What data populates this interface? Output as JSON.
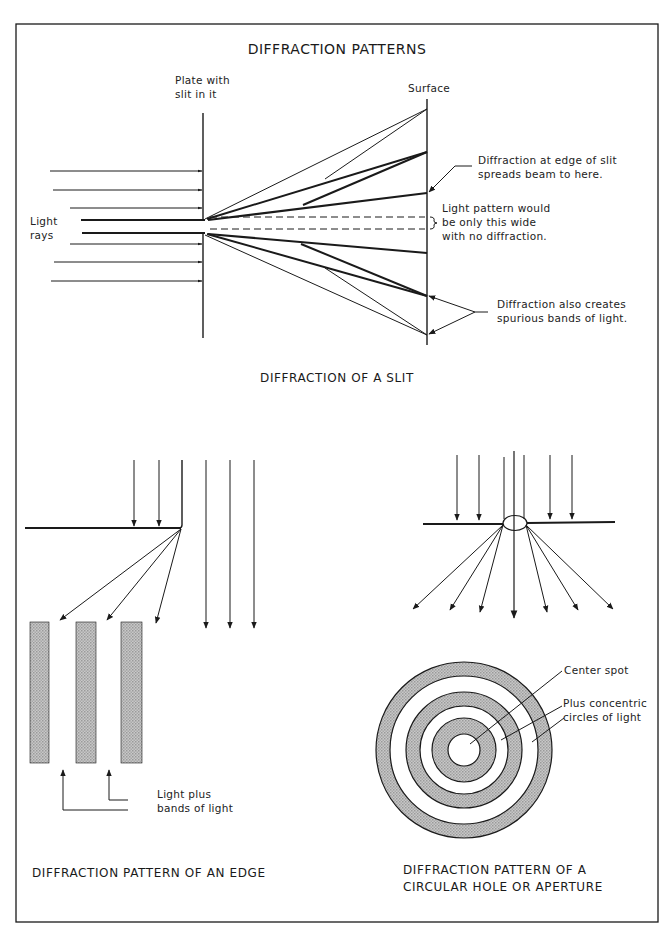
{
  "title": "DIFFRACTION PATTERNS",
  "slit_section": {
    "caption": "DIFFRACTION OF A SLIT",
    "labels": {
      "plate_line1": "Plate with",
      "plate_line2": "slit in it",
      "surface": "Surface",
      "rays_line1": "Light",
      "rays_line2": "rays",
      "edge_spread_line1": "Diffraction at edge of slit",
      "edge_spread_line2": "spreads beam to here.",
      "pattern_line1": "Light pattern would",
      "pattern_line2": "be only this wide",
      "pattern_line3": "with no diffraction.",
      "spurious_line1": "Diffraction also creates",
      "spurious_line2": "spurious bands of light."
    }
  },
  "edge_section": {
    "caption": "DIFFRACTION PATTERN OF AN EDGE",
    "labels": {
      "bands_line1": "Light plus",
      "bands_line2": "bands of light"
    }
  },
  "aperture_section": {
    "caption_line1": "DIFFRACTION PATTERN OF A",
    "caption_line2": "CIRCULAR HOLE OR APERTURE",
    "labels": {
      "center_spot": "Center spot",
      "rings_line1": "Plus concentric",
      "rings_line2": "circles of light"
    }
  },
  "colors": {
    "ink": "#1a1a1a",
    "band_fill": "#b4b4b4",
    "paper": "#ffffff"
  }
}
